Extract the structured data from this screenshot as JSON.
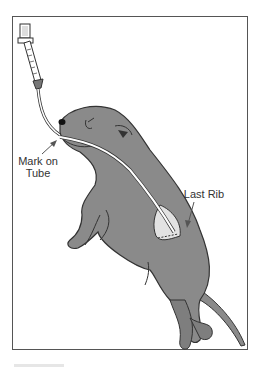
{
  "figure": {
    "labels": {
      "mark_on_tube_line1": "Mark on",
      "mark_on_tube_line2": "Tube",
      "last_rib": "Last Rib"
    },
    "colors": {
      "body_fill": "#8a8a8a",
      "outline": "#333333",
      "stomach_fill": "#e2e2e2",
      "frame": "#555555"
    }
  }
}
